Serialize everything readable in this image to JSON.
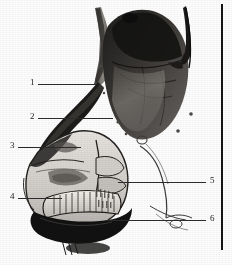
{
  "figure": {
    "width": 232,
    "height": 265,
    "background_color": "#fdfdfd",
    "ink_color": "#1a1a1a"
  },
  "frame": {
    "right_rule_label": "right-frame-rule",
    "right_rule_color": "#141414"
  },
  "callouts": [
    {
      "id": "callout-1",
      "number": "1",
      "side": "left",
      "num_x": 30,
      "num_y": 78,
      "line_x": 38,
      "line_y": 84,
      "line_w": 58
    },
    {
      "id": "callout-2",
      "number": "2",
      "side": "left",
      "num_x": 30,
      "num_y": 112,
      "line_x": 38,
      "line_y": 118,
      "line_w": 75
    },
    {
      "id": "callout-3",
      "number": "3",
      "side": "left",
      "num_x": 10,
      "num_y": 141,
      "line_x": 18,
      "line_y": 147,
      "line_w": 63
    },
    {
      "id": "callout-4",
      "number": "4",
      "side": "left",
      "num_x": 10,
      "num_y": 192,
      "line_x": 18,
      "line_y": 198,
      "line_w": 44
    },
    {
      "id": "callout-5",
      "number": "5",
      "side": "right",
      "num_x": 210,
      "num_y": 176,
      "line_x": 118,
      "line_y": 182,
      "line_w": 88
    },
    {
      "id": "callout-6",
      "number": "6",
      "side": "right",
      "num_x": 210,
      "num_y": 214,
      "line_x": 106,
      "line_y": 220,
      "line_w": 100
    }
  ],
  "regions": [
    {
      "name": "dark-organ-mass",
      "tone": "#2c2c2c"
    },
    {
      "name": "mid-tone-lobe",
      "tone": "#8c8a88"
    },
    {
      "name": "pale-sectioned-block",
      "tone": "#d8d6d2"
    },
    {
      "name": "tooth-row",
      "tone": "#efece7"
    },
    {
      "name": "dark-cavity-floor",
      "tone": "#151515"
    },
    {
      "name": "upper-neck-strip",
      "tone": "#6e6c6a"
    }
  ]
}
